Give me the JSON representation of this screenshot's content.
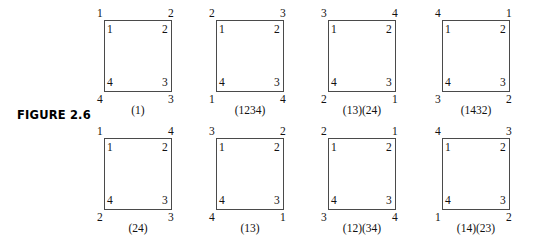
{
  "figure": {
    "caption": "FIGURE 2.6",
    "squares": [
      {
        "id": "square-identity",
        "permutation": "(1)",
        "inner": {
          "tl": "1",
          "tr": "2",
          "bl": "4",
          "br": "3"
        },
        "outer": {
          "tl": "1",
          "tr": "2",
          "bl": "4",
          "br": "3"
        },
        "row": 0,
        "col": 0
      },
      {
        "id": "square-1234",
        "permutation": "(1234)",
        "inner": {
          "tl": "1",
          "tr": "2",
          "bl": "4",
          "br": "3"
        },
        "outer": {
          "tl": "2",
          "tr": "3",
          "bl": "1",
          "br": "4"
        },
        "row": 0,
        "col": 1
      },
      {
        "id": "square-13-24",
        "permutation": "(13)(24)",
        "inner": {
          "tl": "1",
          "tr": "2",
          "bl": "4",
          "br": "3"
        },
        "outer": {
          "tl": "3",
          "tr": "4",
          "bl": "2",
          "br": "1"
        },
        "row": 0,
        "col": 2
      },
      {
        "id": "square-1432",
        "permutation": "(1432)",
        "inner": {
          "tl": "1",
          "tr": "2",
          "bl": "4",
          "br": "3"
        },
        "outer": {
          "tl": "4",
          "tr": "1",
          "bl": "3",
          "br": "2"
        },
        "row": 0,
        "col": 3
      },
      {
        "id": "square-24",
        "permutation": "(24)",
        "inner": {
          "tl": "1",
          "tr": "2",
          "bl": "4",
          "br": "3"
        },
        "outer": {
          "tl": "1",
          "tr": "4",
          "bl": "2",
          "br": "3"
        },
        "row": 1,
        "col": 0
      },
      {
        "id": "square-13",
        "permutation": "(13)",
        "inner": {
          "tl": "1",
          "tr": "2",
          "bl": "4",
          "br": "3"
        },
        "outer": {
          "tl": "3",
          "tr": "2",
          "bl": "4",
          "br": "1"
        },
        "row": 1,
        "col": 1
      },
      {
        "id": "square-12-34",
        "permutation": "(12)(34)",
        "inner": {
          "tl": "1",
          "tr": "2",
          "bl": "4",
          "br": "3"
        },
        "outer": {
          "tl": "2",
          "tr": "1",
          "bl": "3",
          "br": "4"
        },
        "row": 1,
        "col": 2
      },
      {
        "id": "square-14-23",
        "permutation": "(14)(23)",
        "inner": {
          "tl": "1",
          "tr": "2",
          "bl": "4",
          "br": "3"
        },
        "outer": {
          "tl": "4",
          "tr": "3",
          "bl": "1",
          "br": "2"
        },
        "row": 1,
        "col": 3
      }
    ]
  },
  "layout": {
    "col_x": [
      100,
      212,
      324,
      438
    ],
    "row_y": [
      8,
      126
    ],
    "border_color": "#4a4a4a",
    "text_color": "#111111",
    "background": "#ffffff"
  }
}
